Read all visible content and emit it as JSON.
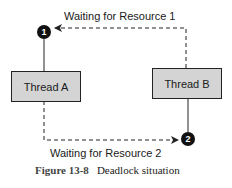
{
  "diagram": {
    "nodes": [
      {
        "id": "thread_a",
        "label": "Thread A"
      },
      {
        "id": "thread_b",
        "label": "Thread B"
      }
    ],
    "markers": [
      {
        "id": "m1",
        "label": "1"
      },
      {
        "id": "m2",
        "label": "2"
      }
    ],
    "edges": [
      {
        "from": "thread_a",
        "to": "m1",
        "style": "solid",
        "meaning": "holds"
      },
      {
        "from": "thread_b",
        "to": "m1",
        "style": "dashed",
        "label": "Waiting for Resource 1"
      },
      {
        "from": "thread_b",
        "to": "m2",
        "style": "solid",
        "meaning": "holds"
      },
      {
        "from": "thread_a",
        "to": "m2",
        "style": "dashed",
        "label": "Waiting for Resource 2"
      }
    ],
    "labels": {
      "wait1": "Waiting for Resource 1",
      "wait2": "Waiting for Resource 2"
    },
    "colors": {
      "box_fill": "#d4d4d4",
      "marker_fill": "#111111",
      "line": "#222222"
    }
  },
  "caption": {
    "figure_number": "Figure 13-8",
    "title": "Deadlock situation"
  }
}
